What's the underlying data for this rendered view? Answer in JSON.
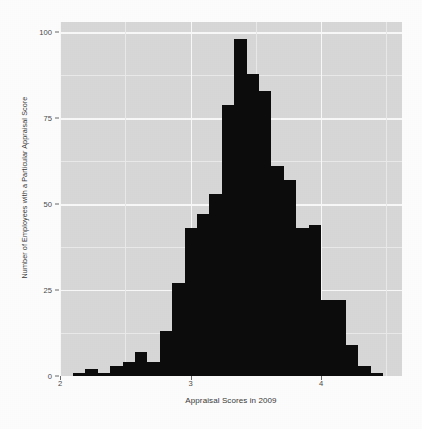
{
  "chart_data": {
    "type": "bar",
    "subtype": "histogram",
    "title": "",
    "xlabel": "Appraisal Scores in 2009",
    "ylabel": "Number of Employees with a Particular Appraisal Score",
    "xlim": [
      2.0,
      4.62
    ],
    "ylim": [
      0,
      103
    ],
    "xticks": [
      2,
      3,
      4
    ],
    "xtick_labels": [
      "2",
      "3",
      "4"
    ],
    "yticks": [
      0,
      25,
      50,
      75,
      100
    ],
    "ytick_labels": [
      "0",
      "25",
      "50",
      "75",
      "100"
    ],
    "grid": true,
    "legend": null,
    "bin_width": 0.095,
    "bar_color": "#0d0d0d",
    "panel_color": "#d9d9d9",
    "gridline_color": "#fbfbfb",
    "bin_starts": [
      2.1,
      2.195,
      2.29,
      2.385,
      2.48,
      2.575,
      2.67,
      2.765,
      2.86,
      2.955,
      3.05,
      3.145,
      3.24,
      3.335,
      3.43,
      3.525,
      3.62,
      3.715,
      3.81,
      3.905,
      4.0,
      4.095,
      4.19,
      4.285,
      4.38
    ],
    "values": [
      1,
      2,
      1,
      3,
      4,
      7,
      4,
      13,
      27,
      43,
      47,
      53,
      79,
      98,
      88,
      83,
      61,
      57,
      43,
      44,
      22,
      22,
      9,
      3,
      1
    ],
    "peak_value": 98,
    "peak_bin": 3.43,
    "n_bins": 25
  },
  "axes": {
    "x_title": "Appraisal Scores in 2009",
    "y_title": "Number of Employees with a Particular Appraisal Score"
  }
}
